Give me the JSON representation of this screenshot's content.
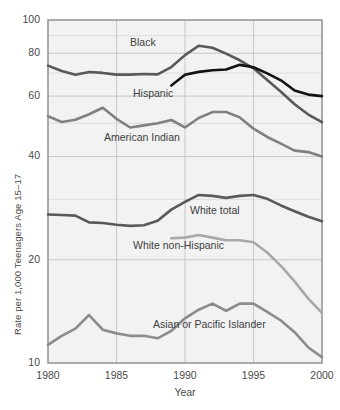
{
  "chart_data": {
    "type": "line",
    "title": "",
    "subtitle": "",
    "xlabel": "Year",
    "ylabel": "Rate per 1,000 Teenagers Age 15–17",
    "yscale": "log",
    "ylim": [
      10,
      100
    ],
    "xlim": [
      1980,
      2000
    ],
    "yticks": [
      10,
      20,
      40,
      60,
      80,
      100
    ],
    "ytick_labels": [
      "10",
      "20",
      "40",
      "60",
      "80",
      "100"
    ],
    "xticks": [
      1980,
      1985,
      1990,
      1995,
      2000
    ],
    "xtick_labels": [
      "1980",
      "1985",
      "1990",
      "1995",
      "2000"
    ],
    "grid": true,
    "legend_position": "inline-annotations",
    "x": [
      1980,
      1981,
      1982,
      1983,
      1984,
      1985,
      1986,
      1987,
      1988,
      1989,
      1990,
      1991,
      1992,
      1993,
      1994,
      1995,
      1996,
      1997,
      1998,
      1999,
      2000
    ],
    "series": [
      {
        "name": "Black",
        "color": "#595959",
        "width": 2.6,
        "label_x": 130,
        "label_y": 36,
        "values": [
          73.6,
          71.0,
          69.2,
          70.5,
          70.1,
          69.3,
          69.3,
          69.6,
          69.4,
          72.9,
          79.0,
          84.1,
          83.0,
          79.8,
          76.3,
          72.3,
          66.8,
          61.8,
          56.8,
          53.0,
          50.4
        ]
      },
      {
        "name": "Hispanic",
        "color": "#121212",
        "width": 2.6,
        "label_x": 133,
        "label_y": 87,
        "values": [
          null,
          null,
          null,
          null,
          null,
          null,
          null,
          null,
          null,
          64.4,
          69.2,
          70.6,
          71.4,
          71.7,
          74.0,
          72.8,
          69.9,
          66.7,
          62.3,
          60.6,
          60.0
        ]
      },
      {
        "name": "American Indian",
        "color": "#808080",
        "width": 2.6,
        "label_x": 104,
        "label_y": 131,
        "values": [
          52.4,
          50.4,
          51.2,
          53.1,
          55.5,
          51.5,
          48.6,
          49.3,
          50.0,
          51.1,
          48.6,
          51.8,
          53.9,
          53.9,
          52.0,
          48.2,
          45.6,
          43.6,
          41.6,
          41.2,
          40.0
        ]
      },
      {
        "name": "White total",
        "color": "#595959",
        "width": 2.6,
        "label_x": 190,
        "label_y": 204,
        "values": [
          27.1,
          27.0,
          26.9,
          25.7,
          25.6,
          25.3,
          25.1,
          25.2,
          26.0,
          28.0,
          29.5,
          30.9,
          30.7,
          30.3,
          30.7,
          30.9,
          30.1,
          28.8,
          27.7,
          26.7,
          25.9
        ]
      },
      {
        "name": "White non-Hispanic",
        "color": "#a8a8a8",
        "width": 2.6,
        "label_x": 133,
        "label_y": 239,
        "values": [
          null,
          null,
          null,
          null,
          null,
          null,
          null,
          null,
          null,
          23.1,
          23.2,
          23.6,
          23.2,
          22.8,
          22.8,
          22.5,
          21.0,
          19.2,
          17.3,
          15.4,
          14.0
        ]
      },
      {
        "name": "Asian or Pacific Islander",
        "color": "#8c8c8c",
        "width": 2.6,
        "label_x": 153,
        "label_y": 318,
        "values": [
          11.3,
          12.0,
          12.6,
          13.8,
          12.5,
          12.2,
          12.0,
          12.0,
          11.8,
          12.4,
          13.5,
          14.3,
          14.9,
          14.2,
          14.9,
          14.9,
          14.1,
          13.3,
          12.3,
          11.1,
          10.4
        ]
      }
    ]
  }
}
